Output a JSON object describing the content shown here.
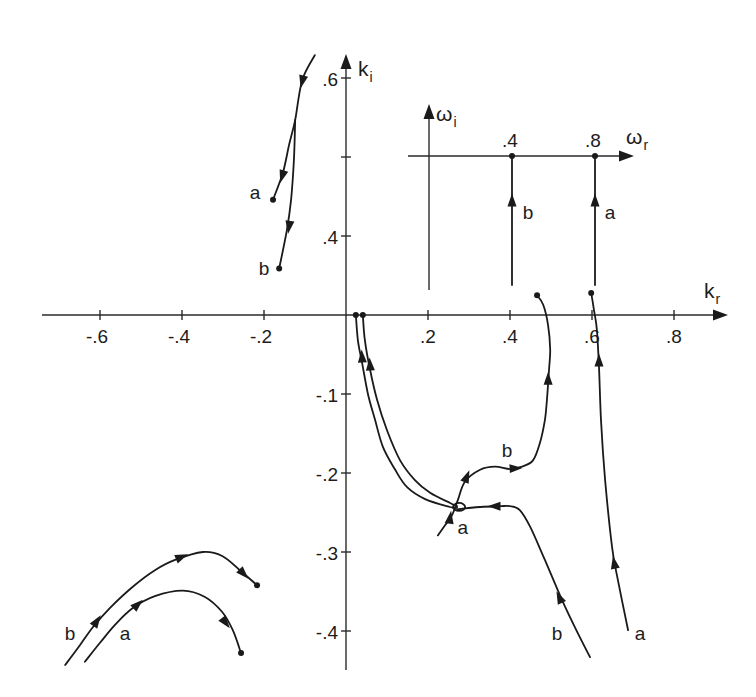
{
  "chart_data": [
    {
      "type": "line",
      "title": "",
      "xlabel": {
        "base": "k",
        "sub": "r"
      },
      "ylabel": {
        "base": "k",
        "sub": "i"
      },
      "xlim": [
        -0.76,
        0.93
      ],
      "ylim": [
        -0.449,
        0.629
      ],
      "upper_axis_offset": 0.3,
      "grid": false,
      "legend": "none (curves labelled a and b directly)",
      "x_ticks": [
        {
          "value": -0.6,
          "label": "-.6"
        },
        {
          "value": -0.4,
          "label": "-.4"
        },
        {
          "value": -0.2,
          "label": "-.2"
        },
        {
          "value": 0.2,
          "label": ".2"
        },
        {
          "value": 0.4,
          "label": ".4"
        },
        {
          "value": 0.6,
          "label": ".6"
        },
        {
          "value": 0.8,
          "label": ".8"
        }
      ],
      "y_ticks": [
        {
          "value": 0.6,
          "label": ".6",
          "upper": true
        },
        {
          "value": 0.5,
          "label": "",
          "upper": true
        },
        {
          "value": 0.4,
          "label": ".4",
          "upper": true
        },
        {
          "value": -0.1,
          "label": "-.1"
        },
        {
          "value": -0.2,
          "label": "-.2"
        },
        {
          "value": -0.3,
          "label": "-.3"
        },
        {
          "value": -0.4,
          "label": "-.4"
        }
      ],
      "series": [
        {
          "name": "upper-left-a",
          "label": "a",
          "upper_break": true,
          "points": [
            [
              -0.076,
              0.629
            ],
            [
              -0.107,
              0.597
            ],
            [
              -0.124,
              0.547
            ],
            [
              -0.139,
              0.515
            ],
            [
              -0.154,
              0.48
            ],
            [
              -0.178,
              0.446
            ]
          ],
          "arrows": [
            [
              [
                -0.1,
                0.61
              ],
              [
                -0.107,
                0.595
              ]
            ],
            [
              [
                -0.146,
                0.492
              ],
              [
                -0.156,
                0.475
              ]
            ]
          ],
          "end_dots": [
            [
              -0.178,
              0.446
            ]
          ]
        },
        {
          "name": "upper-left-b",
          "label": "b",
          "upper_break": true,
          "points": [
            [
              -0.124,
              0.547
            ],
            [
              -0.127,
              0.496
            ],
            [
              -0.134,
              0.446
            ],
            [
              -0.144,
              0.408
            ],
            [
              -0.163,
              0.359
            ]
          ],
          "arrows": [
            [
              [
                -0.134,
                0.429
              ],
              [
                -0.139,
                0.411
              ]
            ]
          ],
          "end_dots": [
            [
              -0.163,
              0.359
            ]
          ]
        },
        {
          "name": "origin-branch-1",
          "points": [
            [
              0.024,
              0.0
            ],
            [
              0.029,
              -0.032
            ],
            [
              0.039,
              -0.06
            ],
            [
              0.054,
              -0.101
            ],
            [
              0.071,
              -0.133
            ],
            [
              0.09,
              -0.167
            ],
            [
              0.12,
              -0.196
            ],
            [
              0.149,
              -0.218
            ],
            [
              0.193,
              -0.233
            ],
            [
              0.254,
              -0.243
            ],
            [
              0.271,
              -0.244
            ]
          ],
          "arrows": [
            [
              [
                0.0415,
                -0.072
              ],
              [
                0.039,
                -0.052
              ]
            ]
          ],
          "end_dots": [
            [
              0.024,
              0.0
            ]
          ]
        },
        {
          "name": "origin-branch-2",
          "points": [
            [
              0.041,
              0.0
            ],
            [
              0.046,
              -0.032
            ],
            [
              0.059,
              -0.07
            ],
            [
              0.076,
              -0.108
            ],
            [
              0.1,
              -0.146
            ],
            [
              0.132,
              -0.184
            ],
            [
              0.168,
              -0.209
            ],
            [
              0.205,
              -0.225
            ],
            [
              0.254,
              -0.238
            ],
            [
              0.271,
              -0.242
            ]
          ],
          "arrows": [
            [
              [
                0.061,
                -0.082
              ],
              [
                0.0585,
                -0.062
              ]
            ]
          ],
          "end_dots": [
            [
              0.041,
              0.0
            ]
          ]
        },
        {
          "name": "lower-right-b",
          "label": "b",
          "points": [
            [
              0.271,
              -0.246
            ],
            [
              0.327,
              -0.243
            ],
            [
              0.376,
              -0.242
            ],
            [
              0.4,
              -0.242
            ],
            [
              0.424,
              -0.247
            ],
            [
              0.449,
              -0.268
            ],
            [
              0.485,
              -0.31
            ],
            [
              0.527,
              -0.361
            ],
            [
              0.559,
              -0.396
            ],
            [
              0.595,
              -0.433
            ]
          ],
          "arrows": [
            [
              [
                0.395,
                -0.242
              ],
              [
                0.361,
                -0.242
              ]
            ],
            [
              [
                0.537,
                -0.376
              ],
              [
                0.52,
                -0.357
              ]
            ]
          ],
          "end_dots": []
        },
        {
          "name": "middle-b",
          "label": "b",
          "points": [
            [
              0.224,
              -0.279
            ],
            [
              0.242,
              -0.266
            ],
            [
              0.259,
              -0.253
            ],
            [
              0.273,
              -0.234
            ],
            [
              0.29,
              -0.211
            ],
            [
              0.327,
              -0.196
            ],
            [
              0.363,
              -0.192
            ],
            [
              0.4,
              -0.195
            ],
            [
              0.429,
              -0.192
            ],
            [
              0.456,
              -0.184
            ],
            [
              0.473,
              -0.162
            ],
            [
              0.485,
              -0.133
            ],
            [
              0.49,
              -0.108
            ],
            [
              0.495,
              -0.07
            ],
            [
              0.498,
              -0.044
            ],
            [
              0.493,
              -0.013
            ],
            [
              0.481,
              0.013
            ],
            [
              0.466,
              0.025
            ]
          ],
          "arrows": [
            [
              [
                0.249,
                -0.273
              ],
              [
                0.254,
                -0.256
              ]
            ],
            [
              [
                0.281,
                -0.222
              ],
              [
                0.295,
                -0.204
              ]
            ],
            [
              [
                0.381,
                -0.195
              ],
              [
                0.415,
                -0.194
              ]
            ],
            [
              [
                0.493,
                -0.099
              ],
              [
                0.493,
                -0.08
              ]
            ]
          ],
          "end_dots": [
            [
              0.466,
              0.025
            ]
          ]
        },
        {
          "name": "right-a",
          "label": "a",
          "points": [
            [
              0.598,
              0.028
            ],
            [
              0.605,
              0.006
            ],
            [
              0.612,
              -0.019
            ],
            [
              0.617,
              -0.066
            ],
            [
              0.622,
              -0.133
            ],
            [
              0.632,
              -0.209
            ],
            [
              0.649,
              -0.294
            ],
            [
              0.663,
              -0.335
            ],
            [
              0.688,
              -0.399
            ]
          ],
          "arrows": [
            [
              [
                0.617,
                -0.076
              ],
              [
                0.617,
                -0.057
              ]
            ],
            [
              [
                0.661,
                -0.332
              ],
              [
                0.654,
                -0.313
              ]
            ]
          ],
          "end_dots": [
            [
              0.598,
              0.028
            ]
          ]
        },
        {
          "name": "lower-left-b",
          "label": "b",
          "points": [
            [
              -0.685,
              -0.443
            ],
            [
              -0.649,
              -0.418
            ],
            [
              -0.617,
              -0.395
            ],
            [
              -0.576,
              -0.371
            ],
            [
              -0.52,
              -0.344
            ],
            [
              -0.466,
              -0.323
            ],
            [
              -0.417,
              -0.31
            ],
            [
              -0.349,
              -0.3
            ],
            [
              -0.302,
              -0.305
            ],
            [
              -0.259,
              -0.323
            ],
            [
              -0.217,
              -0.342
            ]
          ],
          "arrows": [
            [
              [
                -0.629,
                -0.404
              ],
              [
                -0.607,
                -0.387
              ]
            ],
            [
              [
                -0.437,
                -0.314
              ],
              [
                -0.4,
                -0.306
              ]
            ],
            [
              [
                -0.273,
                -0.315
              ],
              [
                -0.249,
                -0.328
              ]
            ]
          ],
          "end_dots": [
            [
              -0.217,
              -0.342
            ]
          ]
        },
        {
          "name": "lower-left-a",
          "label": "a",
          "points": [
            [
              -0.637,
              -0.439
            ],
            [
              -0.6,
              -0.415
            ],
            [
              -0.563,
              -0.392
            ],
            [
              -0.52,
              -0.371
            ],
            [
              -0.466,
              -0.356
            ],
            [
              -0.398,
              -0.349
            ],
            [
              -0.344,
              -0.357
            ],
            [
              -0.302,
              -0.376
            ],
            [
              -0.276,
              -0.399
            ],
            [
              -0.256,
              -0.428
            ]
          ],
          "arrows": [
            [
              [
                -0.534,
                -0.379
              ],
              [
                -0.507,
                -0.366
              ]
            ],
            [
              [
                -0.315,
                -0.375
              ],
              [
                -0.293,
                -0.39
              ]
            ]
          ],
          "end_dots": [
            [
              -0.256,
              -0.428
            ]
          ]
        }
      ],
      "loops": [
        {
          "at": [
            0.271,
            -0.243
          ],
          "radius_px": 5
        }
      ],
      "annotations": [
        {
          "text": "a",
          "at": [
            -0.222,
            0.456
          ],
          "upper": true
        },
        {
          "text": "b",
          "at": [
            -0.2,
            0.359
          ],
          "upper": true
        },
        {
          "text": "b",
          "at": [
            0.393,
            -0.171
          ]
        },
        {
          "text": "a",
          "at": [
            0.285,
            -0.268
          ]
        },
        {
          "text": "b",
          "at": [
            0.515,
            -0.4025
          ]
        },
        {
          "text": "a",
          "at": [
            0.717,
            -0.4025
          ]
        },
        {
          "text": "b",
          "at": [
            -0.673,
            -0.4025
          ]
        },
        {
          "text": "a",
          "at": [
            -0.539,
            -0.4025
          ]
        }
      ]
    },
    {
      "type": "line",
      "title": "inset: frequency plane",
      "xlabel": {
        "base": "ω",
        "sub": "r"
      },
      "ylabel": {
        "base": "ω",
        "sub": "i"
      },
      "xlim": [
        -0.101,
        0.983
      ],
      "ylim": [
        -0.646,
        0.246
      ],
      "x_ticks": [
        {
          "value": 0.4,
          "label": ".4"
        },
        {
          "value": 0.8,
          "label": ".8"
        }
      ],
      "series": [
        {
          "name": "inset-b",
          "label": "b",
          "points": [
            [
              0.4,
              -0.622
            ],
            [
              0.4,
              0.0
            ]
          ],
          "arrows": [
            [
              [
                0.4,
                -0.28
              ],
              [
                0.4,
                -0.212
              ]
            ]
          ],
          "end_dots": [
            [
              0.4,
              0.0
            ]
          ]
        },
        {
          "name": "inset-a",
          "label": "a",
          "points": [
            [
              0.8,
              -0.622
            ],
            [
              0.8,
              0.0
            ]
          ],
          "arrows": [
            [
              [
                0.8,
                -0.28
              ],
              [
                0.8,
                -0.212
              ]
            ]
          ],
          "end_dots": [
            [
              0.8,
              0.0
            ]
          ]
        }
      ],
      "annotations": [
        {
          "text": "b",
          "at": [
            0.477,
            -0.27
          ]
        },
        {
          "text": "a",
          "at": [
            0.872,
            -0.27
          ]
        }
      ]
    }
  ]
}
